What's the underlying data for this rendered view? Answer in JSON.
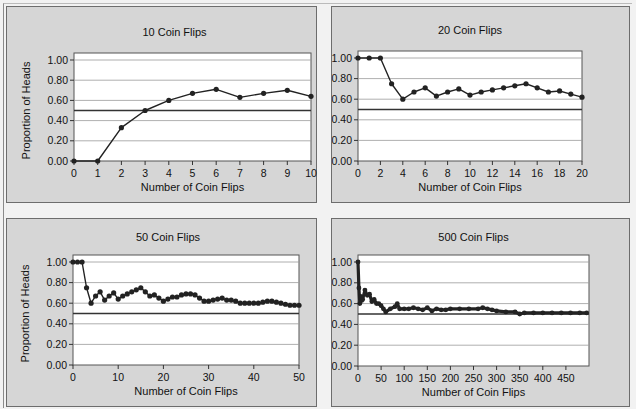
{
  "chart_data": [
    {
      "type": "line",
      "title": "10 Coin Flips",
      "xlabel": "Number of Coin Flips",
      "ylabel": "Proportion of Heads",
      "xlim": [
        0,
        10
      ],
      "ylim": [
        0,
        1.0
      ],
      "xticks": [
        "0",
        "1",
        "2",
        "3",
        "4",
        "5",
        "6",
        "7",
        "8",
        "9",
        "10"
      ],
      "yticks": [
        "0.00",
        "0.20",
        "0.40",
        "0.60",
        "0.80",
        "1.00"
      ],
      "grid": true,
      "reference_line": 0.5,
      "x": [
        0,
        1,
        2,
        3,
        4,
        5,
        6,
        7,
        8,
        9,
        10
      ],
      "series": [
        {
          "name": "Proportion of Heads",
          "values": [
            0.0,
            0.0,
            0.33,
            0.5,
            0.6,
            0.67,
            0.71,
            0.63,
            0.67,
            0.7,
            0.64
          ]
        }
      ]
    },
    {
      "type": "line",
      "title": "20 Coin Flips",
      "xlabel": "Number of Coin Flips",
      "ylabel": "Proportion of Heads",
      "xlim": [
        0,
        20
      ],
      "ylim": [
        0,
        1.0
      ],
      "xticks": [
        "0",
        "2",
        "4",
        "6",
        "8",
        "10",
        "12",
        "14",
        "16",
        "18",
        "20"
      ],
      "yticks": [
        "0.00",
        "0.20",
        "0.40",
        "0.60",
        "0.80",
        "1.00"
      ],
      "grid": true,
      "reference_line": 0.5,
      "x": [
        0,
        1,
        2,
        3,
        4,
        5,
        6,
        7,
        8,
        9,
        10,
        11,
        12,
        13,
        14,
        15,
        16,
        17,
        18,
        19,
        20
      ],
      "series": [
        {
          "name": "Proportion of Heads",
          "values": [
            1.0,
            1.0,
            1.0,
            0.75,
            0.6,
            0.67,
            0.71,
            0.63,
            0.67,
            0.7,
            0.64,
            0.67,
            0.69,
            0.71,
            0.73,
            0.75,
            0.71,
            0.67,
            0.68,
            0.65,
            0.62
          ]
        }
      ]
    },
    {
      "type": "line",
      "title": "50 Coin Flips",
      "xlabel": "Number of Coin Flips",
      "ylabel": "Proportion of Heads",
      "xlim": [
        0,
        50
      ],
      "ylim": [
        0,
        1.0
      ],
      "xticks": [
        "0",
        "10",
        "20",
        "30",
        "40",
        "50"
      ],
      "yticks": [
        "0.00",
        "0.20",
        "0.40",
        "0.60",
        "0.80",
        "1.00"
      ],
      "grid": true,
      "reference_line": 0.5,
      "x": [
        0,
        1,
        2,
        3,
        4,
        5,
        6,
        7,
        8,
        9,
        10,
        11,
        12,
        13,
        14,
        15,
        16,
        17,
        18,
        19,
        20,
        21,
        22,
        23,
        24,
        25,
        26,
        27,
        28,
        29,
        30,
        31,
        32,
        33,
        34,
        35,
        36,
        37,
        38,
        39,
        40,
        41,
        42,
        43,
        44,
        45,
        46,
        47,
        48,
        49,
        50
      ],
      "series": [
        {
          "name": "Proportion of Heads",
          "values": [
            1.0,
            1.0,
            1.0,
            0.75,
            0.6,
            0.67,
            0.71,
            0.63,
            0.67,
            0.7,
            0.64,
            0.67,
            0.69,
            0.71,
            0.73,
            0.75,
            0.71,
            0.67,
            0.68,
            0.65,
            0.62,
            0.64,
            0.66,
            0.66,
            0.68,
            0.69,
            0.69,
            0.68,
            0.65,
            0.62,
            0.62,
            0.63,
            0.64,
            0.65,
            0.63,
            0.63,
            0.62,
            0.6,
            0.6,
            0.6,
            0.6,
            0.6,
            0.61,
            0.62,
            0.62,
            0.61,
            0.6,
            0.59,
            0.58,
            0.58,
            0.58
          ]
        }
      ]
    },
    {
      "type": "line",
      "title": "500 Coin Flips",
      "xlabel": "Number of Coin Flips",
      "ylabel": "Proportion of Heads",
      "xlim": [
        0,
        500
      ],
      "ylim": [
        0,
        1.0
      ],
      "xticks": [
        "0",
        "50",
        "100",
        "150",
        "200",
        "250",
        "300",
        "350",
        "400",
        "450"
      ],
      "yticks": [
        "0.00",
        "0.20",
        "0.40",
        "0.60",
        "0.80",
        "1.00"
      ],
      "grid": true,
      "reference_line": 0.5,
      "x": [
        0,
        2,
        4,
        6,
        8,
        10,
        15,
        20,
        25,
        30,
        35,
        40,
        45,
        50,
        55,
        60,
        70,
        80,
        85,
        90,
        100,
        110,
        120,
        130,
        140,
        150,
        160,
        170,
        180,
        190,
        200,
        220,
        240,
        260,
        270,
        280,
        290,
        300,
        320,
        340,
        350,
        360,
        380,
        400,
        420,
        440,
        460,
        480,
        495
      ],
      "series": [
        {
          "name": "Proportion of Heads",
          "values": [
            1.0,
            0.75,
            0.6,
            0.67,
            0.63,
            0.64,
            0.73,
            0.68,
            0.69,
            0.62,
            0.64,
            0.6,
            0.6,
            0.58,
            0.55,
            0.52,
            0.55,
            0.57,
            0.6,
            0.55,
            0.55,
            0.55,
            0.56,
            0.55,
            0.54,
            0.56,
            0.53,
            0.55,
            0.54,
            0.54,
            0.55,
            0.55,
            0.55,
            0.55,
            0.56,
            0.55,
            0.54,
            0.53,
            0.52,
            0.52,
            0.5,
            0.51,
            0.51,
            0.51,
            0.51,
            0.51,
            0.51,
            0.51,
            0.51
          ]
        }
      ]
    }
  ]
}
